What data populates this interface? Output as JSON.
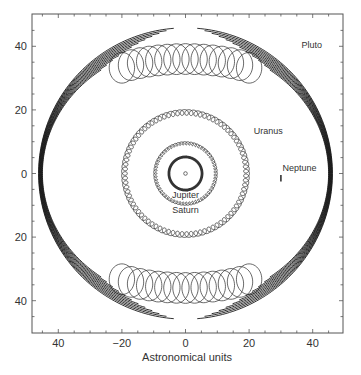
{
  "chart_data": {
    "type": "line",
    "title": "",
    "xlabel": "Astronomical units",
    "ylabel": "",
    "xlim": [
      -48,
      50
    ],
    "ylim": [
      -50,
      48
    ],
    "grid": false,
    "legend": "none (direct labels)",
    "x_ticks": [
      {
        "value": -40,
        "label": "40"
      },
      {
        "value": -20,
        "label": "−20"
      },
      {
        "value": 0,
        "label": "0"
      },
      {
        "value": 20,
        "label": "20"
      },
      {
        "value": 40,
        "label": "40"
      }
    ],
    "y_ticks": [
      {
        "value": 40,
        "label": "40"
      },
      {
        "value": 20,
        "label": "20"
      },
      {
        "value": 0,
        "label": "0"
      },
      {
        "value": -20,
        "label": "20"
      },
      {
        "value": -40,
        "label": "40"
      }
    ],
    "center_marker": {
      "x": 0,
      "y": 0,
      "label": ""
    },
    "series": [
      {
        "name": "Jupiter",
        "orbit_radius_au": 5.2,
        "loop_radius_au": 0.25,
        "loops": 80,
        "label_x": 0,
        "label_y": -6.8
      },
      {
        "name": "Saturn",
        "orbit_radius_au": 9.5,
        "loop_radius_au": 0.5,
        "loops": 60,
        "label_x": 0,
        "label_y": -11.5
      },
      {
        "name": "Uranus",
        "orbit_radius_au": 19.2,
        "loop_radius_au": 0.9,
        "loops": 84,
        "label_x": 21.5,
        "label_y": 13.5
      },
      {
        "name": "Neptune",
        "x_au": 30.0,
        "y_au": -1.5,
        "extent_au": 1.0,
        "label_x": 30.5,
        "label_y": 1.6
      },
      {
        "name": "Pluto",
        "outer_x_au": 46.2,
        "outer_y_au": 45.8,
        "loop_center_y_au": 29.5,
        "loop_radius_au": 4.2,
        "loop_spread_au": 20,
        "strands": 12,
        "label_x": 36.5,
        "label_y": 40.5
      }
    ]
  }
}
